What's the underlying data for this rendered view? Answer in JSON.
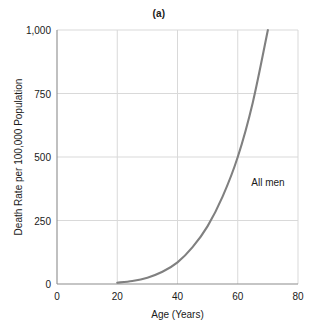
{
  "chart_data": {
    "type": "line",
    "title": "(a)",
    "xlabel": "Age (Years)",
    "ylabel": "Death Rate per 100,000 Population",
    "xlim": [
      0,
      80
    ],
    "ylim": [
      0,
      1000
    ],
    "xticks": [
      0,
      20,
      40,
      60,
      80
    ],
    "xtick_labels": [
      "0",
      "20",
      "40",
      "60",
      "80"
    ],
    "yticks": [
      0,
      250,
      500,
      750,
      1000
    ],
    "ytick_labels": [
      "0",
      "250",
      "500",
      "750",
      "1,000"
    ],
    "grid": true,
    "legend": "none",
    "series": [
      {
        "name": "All men",
        "color": "#808080",
        "annotation": "All men",
        "annotation_x": 64.5,
        "annotation_y": 385,
        "x": [
          20,
          25,
          30,
          35,
          40,
          45,
          50,
          55,
          60,
          65,
          70
        ],
        "values": [
          5,
          12,
          25,
          48,
          85,
          145,
          228,
          345,
          500,
          715,
          1000
        ]
      }
    ]
  },
  "colors": {
    "curve": "#808080",
    "axis": "#8c8c8c",
    "grid": "#d9d9d9",
    "text": "#1a1a1a",
    "background": "#ffffff"
  }
}
